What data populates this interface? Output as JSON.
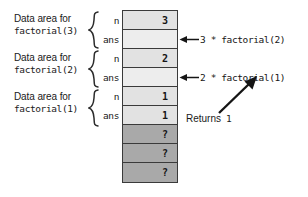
{
  "diagram": {
    "frames": [
      {
        "label_top": "Data area for",
        "label_bottom": "factorial(3)",
        "slots": [
          "n",
          "ans"
        ]
      },
      {
        "label_top": "Data area for",
        "label_bottom": "factorial(2)",
        "slots": [
          "n",
          "ans"
        ]
      },
      {
        "label_top": "Data area for",
        "label_bottom": "factorial(1)",
        "slots": [
          "n",
          "ans"
        ]
      }
    ],
    "stack_cells": [
      {
        "text": "3",
        "kind": "value"
      },
      {
        "text": "",
        "kind": "blank"
      },
      {
        "text": "2",
        "kind": "value"
      },
      {
        "text": "",
        "kind": "blank"
      },
      {
        "text": "1",
        "kind": "value"
      },
      {
        "text": "1",
        "kind": "value"
      },
      {
        "text": "?",
        "kind": "unknown"
      },
      {
        "text": "?",
        "kind": "unknown"
      },
      {
        "text": "?",
        "kind": "unknown"
      }
    ],
    "annotations": [
      {
        "text": "3 * factorial(2)"
      },
      {
        "text": "2 * factorial(1)"
      }
    ],
    "returns": {
      "word": "Returns",
      "value": "1"
    },
    "colors": {
      "value_cell": "#e2e2e2",
      "blank_cell": "#ededed",
      "unknown_cell": "#a9a9a9",
      "border": "#3a3a3a",
      "text": "#151515",
      "background": "#ffffff"
    }
  }
}
